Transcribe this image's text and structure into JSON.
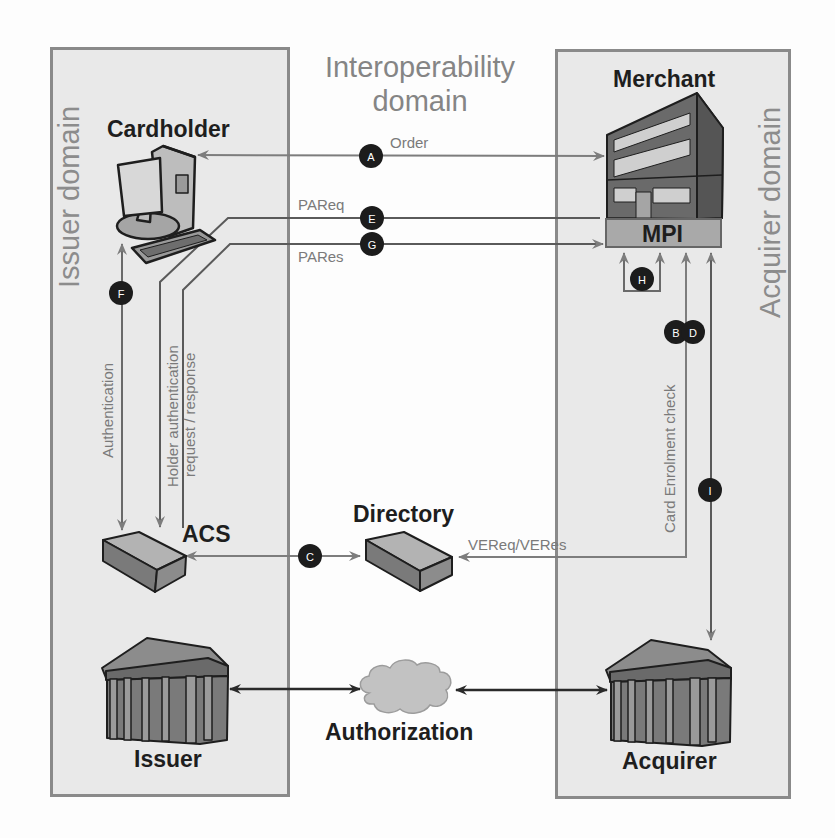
{
  "title": {
    "line1": "Interoperability",
    "line2": "domain"
  },
  "domains": {
    "issuer": "Issuer domain",
    "acquirer": "Acquirer domain",
    "interoperability": "Interoperability domain"
  },
  "entities": {
    "cardholder": "Cardholder",
    "merchant": "Merchant",
    "mpi": "MPI",
    "acs": "ACS",
    "directory": "Directory",
    "issuer": "Issuer",
    "acquirer": "Acquirer",
    "authorization": "Authorization"
  },
  "flows": {
    "order": "Order",
    "pareq": "PAReq",
    "pares": "PARes",
    "authentication": "Authentication",
    "holder_auth_line1": "Holder authentication",
    "holder_auth_line2": "request / response",
    "card_enrolment": "Card Enrolment check",
    "vereq_veres": "VEReq/VERes"
  },
  "badges": [
    "A",
    "B",
    "C",
    "D",
    "E",
    "F",
    "G",
    "H",
    "I"
  ],
  "colors": {
    "domain_fill": "#e9e9e9",
    "domain_border": "#8a8a8a",
    "flow_line": "#7d7d7d",
    "auth_line": "#2a2a2a",
    "badge_fill": "#1c1c1c",
    "label_dark": "#1e1e1e",
    "label_gray": "#858585"
  }
}
